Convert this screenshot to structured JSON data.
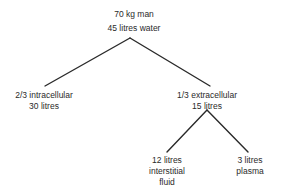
{
  "root": {
    "line1": "70 kg man",
    "line2": "45 litres water"
  },
  "intracellular": {
    "line1": "2/3 intracellular",
    "line2": "30 litres"
  },
  "extracellular": {
    "line1": "1/3 extracellular",
    "line2": "15 litres"
  },
  "interstitial": {
    "line1": "12 litres",
    "line2": "interstitial",
    "line3": "fluid"
  },
  "plasma": {
    "line1": "3 litres",
    "line2": "plasma"
  }
}
